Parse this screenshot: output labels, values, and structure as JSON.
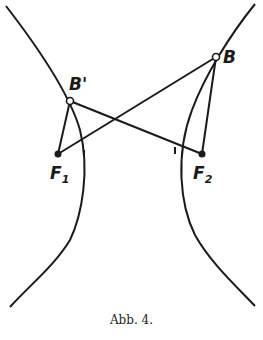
{
  "figure": {
    "caption": "Abb. 4.",
    "points": {
      "B": {
        "label": "B",
        "x": 216,
        "y": 57
      },
      "B_prime": {
        "label": "B'",
        "x": 70,
        "y": 101
      },
      "F1": {
        "label": "F",
        "sub": "1",
        "x": 58,
        "y": 154
      },
      "F2": {
        "label": "F",
        "sub": "2",
        "x": 202,
        "y": 154
      }
    },
    "colors": {
      "ink": "#1a1a1a",
      "background": "#ffffff"
    }
  }
}
